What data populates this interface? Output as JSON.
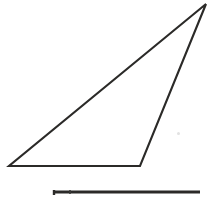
{
  "figure": {
    "background_color": "#ffffff",
    "stroke_color": "#2b2a28",
    "width": 213,
    "height": 200,
    "shapes": [
      {
        "name": "triangle",
        "type": "polygon",
        "label": "triangle",
        "fill": "none",
        "stroke": "#2b2a28",
        "stroke_width": 2.1,
        "points": "9,166 140,166 206,4",
        "vertices": [
          {
            "name": "bottom-left-vertex",
            "x": 9,
            "y": 166
          },
          {
            "name": "bottom-right-vertex",
            "x": 140,
            "y": 166
          },
          {
            "name": "apex-vertex",
            "x": 206,
            "y": 4
          }
        ]
      },
      {
        "name": "baseline-segment",
        "type": "line",
        "label": "horizontal segment",
        "stroke": "#2b2a28",
        "stroke_width": 3.2,
        "x1": 54,
        "y1": 192,
        "x2": 200,
        "y2": 192
      },
      {
        "name": "baseline-left-tick",
        "type": "line",
        "label": "left tick mark",
        "stroke": "#2b2a28",
        "stroke_width": 2.4,
        "x1": 54,
        "y1": 190,
        "x2": 54,
        "y2": 195
      },
      {
        "name": "baseline-inner-tick",
        "type": "line",
        "label": "inner tick mark",
        "stroke": "#3a3936",
        "stroke_width": 1.6,
        "x1": 70,
        "y1": 190,
        "x2": 70,
        "y2": 194
      }
    ],
    "artifacts": [
      {
        "name": "paper-speck",
        "x": 178,
        "y": 133,
        "color": "#e2e2e2"
      }
    ]
  }
}
